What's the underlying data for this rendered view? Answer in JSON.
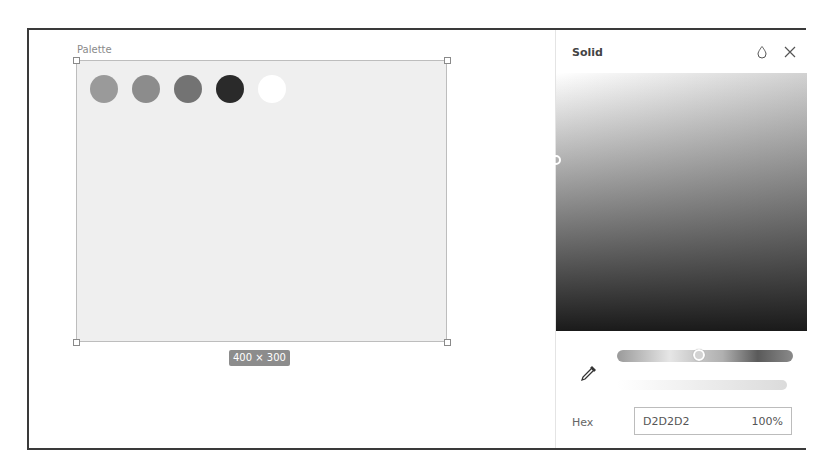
{
  "canvas": {
    "frame_label": "Palette",
    "size_badge": "400 × 300",
    "artboard_fill": "#efefef",
    "swatches": [
      {
        "color": "#9a9a9a"
      },
      {
        "color": "#8c8c8c"
      },
      {
        "color": "#737373"
      },
      {
        "color": "#2a2a2a"
      },
      {
        "color": "#ffffff"
      }
    ]
  },
  "color_panel": {
    "title": "Solid",
    "icons": {
      "style": "drop-icon",
      "close": "close-icon",
      "eyedropper": "eyedropper-icon"
    },
    "hex_label": "Hex",
    "hex_value": "D2D2D2",
    "opacity": "100%"
  }
}
